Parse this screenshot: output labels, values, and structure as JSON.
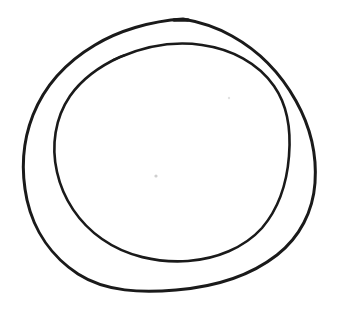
{
  "canvas": {
    "width": 340,
    "height": 312,
    "background_color": "#ffffff",
    "paper_tint": "#fdfdfd",
    "description": "Hand-drawn double circle (annotation circle drawn twice) in black ink on white paper"
  },
  "ink": {
    "color": "#1a1a1a",
    "secondary_color": "#2b2b2b",
    "speck_color": "#cfcfcf"
  },
  "strokes": {
    "outer": {
      "name": "outer-circle-stroke",
      "color": "#1a1a1a",
      "width": 3.0,
      "bounds": {
        "left": 23,
        "top": 18,
        "right": 316,
        "bottom": 291
      },
      "center": {
        "x": 170,
        "y": 155
      },
      "radius_x": 146,
      "radius_y": 137,
      "path": "M 183 19 C 150 21 118 31 95 45 C 68 61 45 85 33 115 C 22 143 21 172 27 200 C 34 231 52 257 78 274 C 106 292 142 293 176 290 C 213 287 250 276 277 255 C 300 237 313 211 315 183 C 317 155 310 126 296 101 C 281 74 259 51 232 36 C 218 28 201 22 183 19 Z"
    },
    "outer_tail": {
      "name": "outer-stroke-start-nub",
      "color": "#1a1a1a",
      "width": 3.4,
      "path": "M 174 20 L 188 20"
    },
    "inner": {
      "name": "inner-circle-stroke",
      "color": "#1a1a1a",
      "width": 2.6,
      "bounds": {
        "left": 54,
        "top": 42,
        "right": 291,
        "bottom": 261
      },
      "center": {
        "x": 172,
        "y": 151
      },
      "radius_x": 118,
      "radius_y": 109,
      "path": "M 120 57 C 146 46 175 41 202 45 C 231 49 258 63 274 86 C 288 106 291 132 289 156 C 287 182 279 208 262 228 C 244 248 216 259 188 261 C 157 263 126 256 102 239 C 79 223 63 199 57 172 C 51 146 55 118 70 96 C 82 79 100 66 120 57 Z"
    },
    "inner_tick": {
      "name": "inner-stroke-tick-mark",
      "color": "#1a1a1a",
      "width": 2.0,
      "path": "M 113 60 L 125 55"
    }
  },
  "artifacts": [
    {
      "name": "paper-speck",
      "x": 156,
      "y": 176,
      "radius": 1.6,
      "color": "#cfcfcf"
    },
    {
      "name": "paper-speck",
      "x": 229,
      "y": 98,
      "radius": 1.2,
      "color": "#e2e2e2"
    }
  ]
}
